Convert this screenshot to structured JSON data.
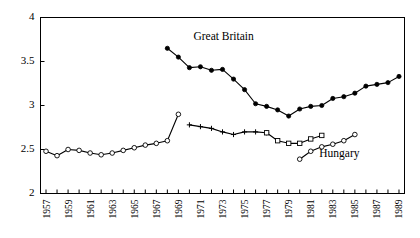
{
  "chart_data": {
    "type": "line",
    "title": "",
    "xlabel": "",
    "ylabel": "",
    "xlim": [
      1956.5,
      1989.5
    ],
    "ylim": [
      2,
      4
    ],
    "yticks": [
      2,
      2.5,
      3,
      3.5,
      4
    ],
    "ytick_labels": [
      "2",
      "2.5",
      "3",
      "3.5",
      "4"
    ],
    "xticks": [
      1957,
      1958,
      1959,
      1960,
      1961,
      1962,
      1963,
      1964,
      1965,
      1966,
      1967,
      1968,
      1969,
      1970,
      1971,
      1972,
      1973,
      1974,
      1975,
      1976,
      1977,
      1978,
      1979,
      1980,
      1981,
      1982,
      1983,
      1984,
      1985,
      1986,
      1987,
      1988,
      1989
    ],
    "xtick_labels_shown": [
      "1957",
      "1959",
      "1961",
      "1963",
      "1965",
      "1967",
      "1969",
      "1971",
      "1973",
      "1975",
      "1977",
      "1979",
      "1981",
      "1983",
      "1985",
      "1987",
      "1989"
    ],
    "xtick_label_rotation": -90,
    "grid": false,
    "legend_position": "inline-annotation",
    "series": [
      {
        "name": "Great Britain",
        "marker": "filled-circle",
        "color": "#000000",
        "label_x": 1973.1,
        "label_y": 3.74,
        "points": [
          {
            "x": 1968,
            "y": 3.65
          },
          {
            "x": 1969,
            "y": 3.55
          },
          {
            "x": 1970,
            "y": 3.43
          },
          {
            "x": 1971,
            "y": 3.44
          },
          {
            "x": 1972,
            "y": 3.4
          },
          {
            "x": 1973,
            "y": 3.41
          },
          {
            "x": 1974,
            "y": 3.3
          },
          {
            "x": 1975,
            "y": 3.18
          },
          {
            "x": 1976,
            "y": 3.02
          },
          {
            "x": 1977,
            "y": 2.99
          },
          {
            "x": 1978,
            "y": 2.95
          },
          {
            "x": 1979,
            "y": 2.88
          },
          {
            "x": 1980,
            "y": 2.96
          },
          {
            "x": 1981,
            "y": 2.99
          },
          {
            "x": 1982,
            "y": 3.0
          },
          {
            "x": 1983,
            "y": 3.08
          },
          {
            "x": 1984,
            "y": 3.1
          },
          {
            "x": 1985,
            "y": 3.14
          },
          {
            "x": 1986,
            "y": 3.22
          },
          {
            "x": 1987,
            "y": 3.24
          },
          {
            "x": 1988,
            "y": 3.26
          },
          {
            "x": 1989,
            "y": 3.33
          },
          {
            "x": 1990,
            "y": 3.36
          },
          {
            "x": 1991,
            "y": 3.41
          }
        ]
      },
      {
        "name": "Hungary",
        "marker": "open-circle",
        "color": "#000000",
        "label_x": 1983.6,
        "label_y": 2.42,
        "points": [
          {
            "x": 1957,
            "y": 2.48
          },
          {
            "x": 1958,
            "y": 2.43
          },
          {
            "x": 1959,
            "y": 2.5
          },
          {
            "x": 1960,
            "y": 2.49
          },
          {
            "x": 1961,
            "y": 2.46
          },
          {
            "x": 1962,
            "y": 2.44
          },
          {
            "x": 1963,
            "y": 2.46
          },
          {
            "x": 1964,
            "y": 2.49
          },
          {
            "x": 1965,
            "y": 2.52
          },
          {
            "x": 1966,
            "y": 2.55
          },
          {
            "x": 1967,
            "y": 2.57
          },
          {
            "x": 1968,
            "y": 2.6
          },
          {
            "x": 1969,
            "y": 2.9
          }
        ]
      },
      {
        "name": "Hungary (segment 2)",
        "marker": "plus-cross",
        "color": "#000000",
        "points": [
          {
            "x": 1970,
            "y": 2.78
          },
          {
            "x": 1971,
            "y": 2.76
          },
          {
            "x": 1972,
            "y": 2.74
          },
          {
            "x": 1973,
            "y": 2.7
          },
          {
            "x": 1974,
            "y": 2.67
          },
          {
            "x": 1975,
            "y": 2.7
          },
          {
            "x": 1976,
            "y": 2.7
          },
          {
            "x": 1977,
            "y": 2.69
          }
        ]
      },
      {
        "name": "Hungary (segment 3)",
        "marker": "open-square",
        "color": "#000000",
        "points": [
          {
            "x": 1977,
            "y": 2.69
          },
          {
            "x": 1978,
            "y": 2.6
          },
          {
            "x": 1979,
            "y": 2.57
          },
          {
            "x": 1980,
            "y": 2.57
          },
          {
            "x": 1981,
            "y": 2.62
          },
          {
            "x": 1982,
            "y": 2.66
          }
        ]
      },
      {
        "name": "Hungary (segment 4)",
        "marker": "open-circle",
        "color": "#000000",
        "points": [
          {
            "x": 1980,
            "y": 2.39
          },
          {
            "x": 1981,
            "y": 2.48
          },
          {
            "x": 1982,
            "y": 2.53
          },
          {
            "x": 1983,
            "y": 2.56
          },
          {
            "x": 1984,
            "y": 2.6
          },
          {
            "x": 1985,
            "y": 2.67
          }
        ]
      }
    ]
  },
  "axis": {
    "y_labels": [
      "2",
      "2.5",
      "3",
      "3.5",
      "4"
    ],
    "x_labels": [
      "1957",
      "1959",
      "1961",
      "1963",
      "1965",
      "1967",
      "1969",
      "1971",
      "1973",
      "1975",
      "1977",
      "1979",
      "1981",
      "1983",
      "1985",
      "1987",
      "1989"
    ]
  },
  "annotations": {
    "great_britain": "Great Britain",
    "hungary": "Hungary"
  }
}
